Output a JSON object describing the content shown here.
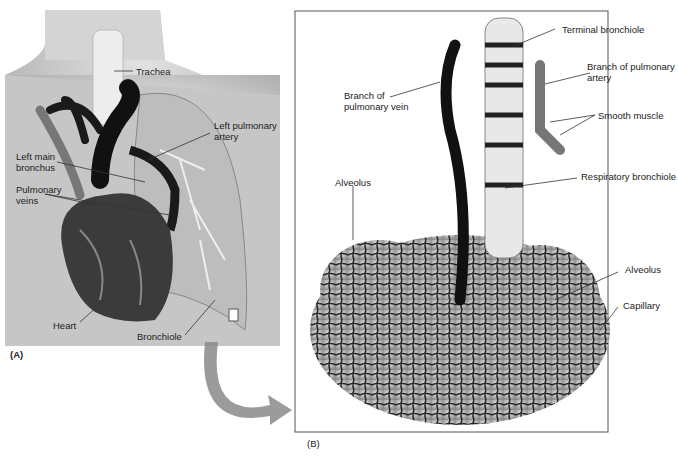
{
  "figure": {
    "panels": [
      {
        "id": "A",
        "label": "(A)",
        "subject": "Thorax with heart and lungs"
      },
      {
        "id": "B",
        "label": "(B)",
        "subject": "Alveolar cluster with bronchiole and vessels"
      }
    ]
  },
  "panel_a": {
    "labels": {
      "trachea": "Trachea",
      "left_pulmonary_artery": "Left pulmonary\nartery",
      "left_main_bronchus": "Left main\nbronchus",
      "pulmonary_veins": "Pulmonary\nveins",
      "heart": "Heart",
      "bronchiole": "Bronchiole"
    },
    "panel_label": "(A)"
  },
  "panel_b": {
    "labels": {
      "terminal_bronchiole": "Terminal bronchiole",
      "branch_pulmonary_artery": "Branch of pulmonary\nartery",
      "branch_pulmonary_vein": "Branch of\npulmonary vein",
      "smooth_muscle": "Smooth muscle",
      "alveolus_left": "Alveolus",
      "respiratory_bronchiole": "Respiratory bronchiole",
      "alveolus_right": "Alveolus",
      "capillary": "Capillary"
    },
    "panel_label": "(B)"
  },
  "colors": {
    "skin": "#c9c9c9",
    "vessel_dark": "#1a1a1a",
    "arrow": "#8a8a8a",
    "border": "#555555"
  }
}
